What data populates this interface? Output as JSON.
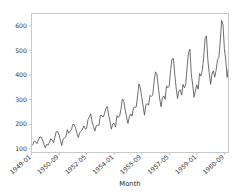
{
  "chart_data": {
    "type": "line",
    "title": "",
    "xlabel": "Month",
    "ylabel": "",
    "ylim": [
      85,
      650
    ],
    "yticks": [
      100,
      200,
      300,
      400,
      500,
      600
    ],
    "ytick_labels": [
      "100",
      "200",
      "300",
      "400",
      "500",
      "600"
    ],
    "xtick_indices": [
      0,
      20,
      40,
      60,
      80,
      100,
      120,
      140
    ],
    "xtick_labels": [
      "1949-01",
      "1950-09",
      "1952-05",
      "1954-01",
      "1955-09",
      "1957-05",
      "1959-01",
      "1960-09"
    ],
    "grid": false,
    "legend": null,
    "line_color": "#4a4a4a",
    "background_color": "#ffffff",
    "spine_color": "#c9c9c9",
    "x": [
      "1949-01",
      "1949-02",
      "1949-03",
      "1949-04",
      "1949-05",
      "1949-06",
      "1949-07",
      "1949-08",
      "1949-09",
      "1949-10",
      "1949-11",
      "1949-12",
      "1950-01",
      "1950-02",
      "1950-03",
      "1950-04",
      "1950-05",
      "1950-06",
      "1950-07",
      "1950-08",
      "1950-09",
      "1950-10",
      "1950-11",
      "1950-12",
      "1951-01",
      "1951-02",
      "1951-03",
      "1951-04",
      "1951-05",
      "1951-06",
      "1951-07",
      "1951-08",
      "1951-09",
      "1951-10",
      "1951-11",
      "1951-12",
      "1952-01",
      "1952-02",
      "1952-03",
      "1952-04",
      "1952-05",
      "1952-06",
      "1952-07",
      "1952-08",
      "1952-09",
      "1952-10",
      "1952-11",
      "1952-12",
      "1953-01",
      "1953-02",
      "1953-03",
      "1953-04",
      "1953-05",
      "1953-06",
      "1953-07",
      "1953-08",
      "1953-09",
      "1953-10",
      "1953-11",
      "1953-12",
      "1954-01",
      "1954-02",
      "1954-03",
      "1954-04",
      "1954-05",
      "1954-06",
      "1954-07",
      "1954-08",
      "1954-09",
      "1954-10",
      "1954-11",
      "1954-12",
      "1955-01",
      "1955-02",
      "1955-03",
      "1955-04",
      "1955-05",
      "1955-06",
      "1955-07",
      "1955-08",
      "1955-09",
      "1955-10",
      "1955-11",
      "1955-12",
      "1956-01",
      "1956-02",
      "1956-03",
      "1956-04",
      "1956-05",
      "1956-06",
      "1956-07",
      "1956-08",
      "1956-09",
      "1956-10",
      "1956-11",
      "1956-12",
      "1957-01",
      "1957-02",
      "1957-03",
      "1957-04",
      "1957-05",
      "1957-06",
      "1957-07",
      "1957-08",
      "1957-09",
      "1957-10",
      "1957-11",
      "1957-12",
      "1958-01",
      "1958-02",
      "1958-03",
      "1958-04",
      "1958-05",
      "1958-06",
      "1958-07",
      "1958-08",
      "1958-09",
      "1958-10",
      "1958-11",
      "1958-12",
      "1959-01",
      "1959-02",
      "1959-03",
      "1959-04",
      "1959-05",
      "1959-06",
      "1959-07",
      "1959-08",
      "1959-09",
      "1959-10",
      "1959-11",
      "1959-12",
      "1960-01",
      "1960-02",
      "1960-03",
      "1960-04",
      "1960-05",
      "1960-06",
      "1960-07",
      "1960-08",
      "1960-09",
      "1960-10",
      "1960-11",
      "1960-12"
    ],
    "values": [
      112,
      118,
      132,
      129,
      121,
      135,
      148,
      148,
      136,
      119,
      104,
      118,
      115,
      126,
      141,
      135,
      125,
      149,
      170,
      170,
      158,
      133,
      114,
      140,
      145,
      150,
      178,
      163,
      172,
      178,
      199,
      199,
      184,
      162,
      146,
      166,
      171,
      180,
      193,
      181,
      183,
      218,
      230,
      242,
      209,
      191,
      172,
      194,
      196,
      196,
      236,
      235,
      229,
      243,
      264,
      272,
      237,
      211,
      180,
      201,
      204,
      188,
      235,
      227,
      234,
      264,
      302,
      293,
      259,
      229,
      203,
      229,
      242,
      233,
      267,
      269,
      270,
      315,
      364,
      347,
      312,
      274,
      237,
      278,
      284,
      277,
      317,
      313,
      318,
      374,
      413,
      405,
      355,
      306,
      271,
      306,
      315,
      301,
      356,
      348,
      355,
      422,
      465,
      467,
      404,
      347,
      305,
      336,
      340,
      318,
      362,
      348,
      363,
      435,
      491,
      505,
      404,
      359,
      310,
      337,
      360,
      342,
      406,
      396,
      420,
      472,
      548,
      559,
      463,
      407,
      362,
      405,
      417,
      391,
      419,
      461,
      472,
      535,
      622,
      606,
      508,
      461,
      390,
      432
    ]
  }
}
